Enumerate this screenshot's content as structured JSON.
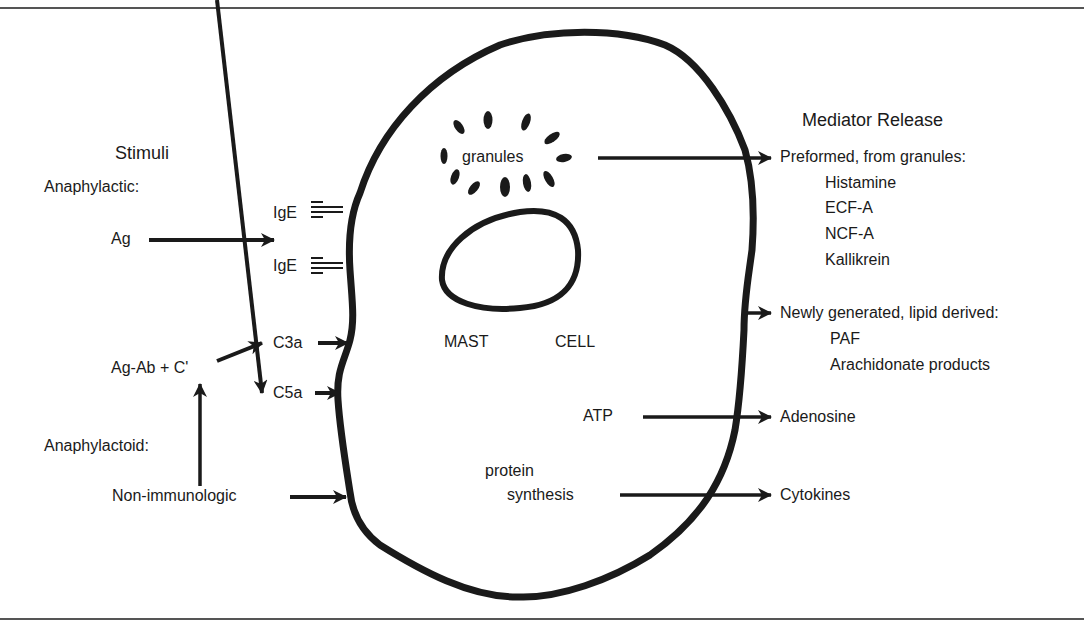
{
  "figure": {
    "title_left": "Stimuli",
    "title_right": "Mediator Release",
    "cell_label_1": "MAST",
    "cell_label_2": "CELL"
  },
  "stimuli": {
    "anaphylactic_label": "Anaphylactic:",
    "antigen": "Ag",
    "ige_top": "IgE",
    "ige_bottom": "IgE",
    "complex": "Ag-Ab + C'",
    "c3a": "C3a",
    "c5a": "C5a",
    "anaphylactoid_label": "Anaphylactoid:",
    "non_immunologic": "Non-immunologic"
  },
  "cell_internal": {
    "granules": "granules",
    "atp": "ATP",
    "protein": "protein",
    "synthesis": "synthesis"
  },
  "mediators": {
    "preformed": {
      "heading": "Preformed, from granules:",
      "items": [
        "Histamine",
        "ECF-A",
        "NCF-A",
        "Kallikrein"
      ]
    },
    "newly_generated": {
      "heading": "Newly generated, lipid derived:",
      "items": [
        "PAF",
        "Arachidonate products"
      ]
    },
    "adenosine": "Adenosine",
    "cytokines": "Cytokines"
  },
  "colors": {
    "ink": "#1a1a1a",
    "frame": "#555555",
    "background": "#ffffff"
  }
}
